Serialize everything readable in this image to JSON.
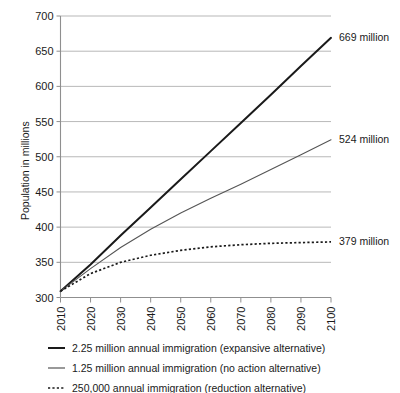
{
  "chart_data": {
    "type": "line",
    "title": "",
    "xlabel": "",
    "ylabel": "Population in millions",
    "xlim": [
      2010,
      2100
    ],
    "ylim": [
      300,
      700
    ],
    "grid": true,
    "legend_position": "bottom-left",
    "x": [
      2010,
      2020,
      2030,
      2040,
      2050,
      2060,
      2070,
      2080,
      2090,
      2100
    ],
    "xtick_labels": [
      "2010",
      "2020",
      "2030",
      "2040",
      "2050",
      "2060",
      "2070",
      "2080",
      "2090",
      "2100"
    ],
    "ytick_labels": [
      "300",
      "350",
      "400",
      "450",
      "500",
      "550",
      "600",
      "650",
      "700"
    ],
    "ytick_values": [
      300,
      350,
      400,
      450,
      500,
      550,
      600,
      650,
      700
    ],
    "series": [
      {
        "name": "2.25 million annual immigration (expansive alternative)",
        "style": "solid-thick",
        "color": "#1a1a1a",
        "values": [
          309,
          347,
          388,
          428,
          468,
          508,
          548,
          588,
          629,
          669
        ],
        "end_label": "669 million"
      },
      {
        "name": "1.25 million annual immigration (no action alternative)",
        "style": "solid-thin",
        "color": "#555555",
        "values": [
          309,
          341,
          371,
          397,
          420,
          441,
          461,
          482,
          503,
          524
        ],
        "end_label": "524 million"
      },
      {
        "name": "250,000 annual immigration (reduction alternative)",
        "style": "dotted",
        "color": "#1a1a1a",
        "values": [
          309,
          334,
          350,
          360,
          367,
          372,
          375,
          377,
          378,
          379
        ],
        "end_label": "379 million"
      }
    ],
    "annotations": [
      {
        "text": "669 million",
        "series": 0
      },
      {
        "text": "524 million",
        "series": 1
      },
      {
        "text": "379 million",
        "series": 2
      }
    ]
  },
  "legend": {
    "items": [
      {
        "marker": "solid-thick",
        "label": "2.25 million annual immigration (expansive alternative)"
      },
      {
        "marker": "solid-thin",
        "label": "1.25 million annual immigration (no action alternative)"
      },
      {
        "marker": "dotted",
        "label": "250,000 annual immigration (reduction alternative)"
      }
    ]
  },
  "colors": {
    "expansive": "#1a1a1a",
    "no_action": "#555555",
    "reduction": "#1a1a1a",
    "grid": "#9a9a9a",
    "axis": "#8f8f8f",
    "background": "#ffffff"
  }
}
